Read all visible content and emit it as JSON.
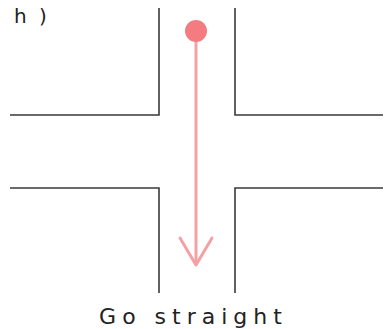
{
  "panel": {
    "label": "h )"
  },
  "diagram": {
    "type": "intersection-straight-through",
    "road_color": "#3a3a3a",
    "arrow_color": "#f4a0a4",
    "start_dot_color": "#f47c80",
    "direction": "straight-down"
  },
  "caption": {
    "text": "Go straight"
  }
}
